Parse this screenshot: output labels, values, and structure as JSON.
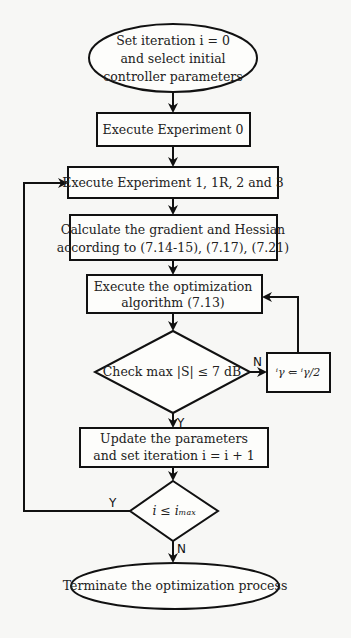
{
  "flowchart": {
    "start": {
      "lines": [
        "Set iteration i = 0",
        "and select initial",
        "controller parameters"
      ]
    },
    "step_exp0": {
      "lines": [
        "Execute Experiment 0"
      ]
    },
    "step_exp123": {
      "lines": [
        "Execute Experiment 1, 1R, 2 and 3"
      ]
    },
    "step_grad": {
      "lines": [
        "Calculate the gradient and Hessian",
        "according to (7.14-15), (7.17), (7.21)"
      ]
    },
    "step_opt": {
      "lines": [
        "Execute the optimization",
        "algorithm (7.13)"
      ]
    },
    "decision_s": {
      "lines": [
        "Check max |S| ≤ 7 dB"
      ]
    },
    "step_gamma": {
      "lines": [
        "ⁱγ ⇐ ⁱγ/2"
      ]
    },
    "step_update": {
      "lines": [
        "Update the parameters",
        "and set iteration i = i + 1"
      ]
    },
    "decision_imax": {
      "lines": [
        "i ≤ iₘₐₓ"
      ]
    },
    "end": {
      "lines": [
        "Terminate the optimization process"
      ]
    },
    "edge_labels": {
      "s_no": "N",
      "s_yes": "Y",
      "imax_yes": "Y",
      "imax_no": "N"
    }
  }
}
